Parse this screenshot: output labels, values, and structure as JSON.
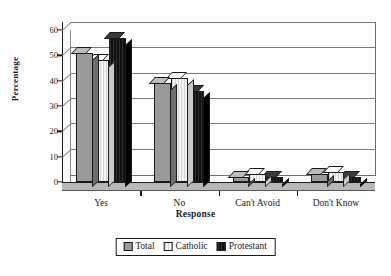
{
  "chart_data": {
    "type": "bar",
    "title": "",
    "subtitle": "",
    "xlabel": "Response",
    "ylabel": "Percentage",
    "categories": [
      "Yes",
      "No",
      "Can't Avoid",
      "Don't Know"
    ],
    "series": [
      {
        "name": "Total",
        "values": [
          51,
          39,
          2,
          3
        ],
        "color": "#9a9a9a",
        "pattern": "dotted-gray"
      },
      {
        "name": "Catholic",
        "values": [
          48,
          41,
          3,
          4
        ],
        "color": "#f4f4f2",
        "pattern": "light-white"
      },
      {
        "name": "Protestant",
        "values": [
          57,
          36,
          2,
          2
        ],
        "color": "#111111",
        "pattern": "solid-black"
      }
    ],
    "ylim": [
      0,
      60
    ],
    "yticks": [
      0,
      10,
      20,
      30,
      40,
      50,
      60
    ],
    "ytick_labels": [
      "0",
      "10",
      "20",
      "30",
      "40",
      "50",
      "60"
    ],
    "grid": true,
    "grid_axis": "y",
    "legend_position": "bottom-center",
    "style": "3d-column"
  },
  "axes": {
    "y_title": "Percentage",
    "x_title": "Response"
  },
  "legend": {
    "entries": [
      {
        "label": "Total"
      },
      {
        "label": "Catholic"
      },
      {
        "label": "Protestant"
      }
    ]
  }
}
